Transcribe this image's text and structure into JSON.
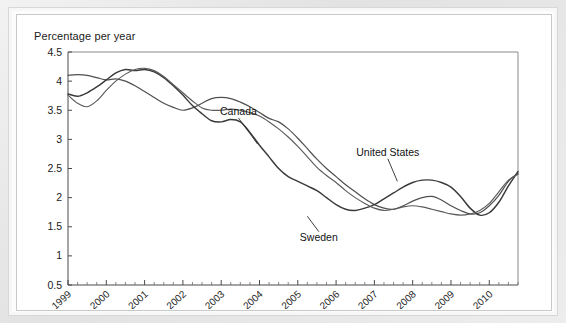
{
  "chart_data": {
    "type": "line",
    "title": "",
    "subtitle": "",
    "ylabel": "Percentage per year",
    "xlabel": "",
    "ylim": [
      0.5,
      4.5
    ],
    "ytick_labels": [
      "4.5",
      "4",
      "3.5",
      "3",
      "2.5",
      "2",
      "1.5",
      "1",
      "0.5"
    ],
    "ytick_values": [
      4.5,
      4,
      3.5,
      3,
      2.5,
      2,
      1.5,
      1,
      0.5
    ],
    "xlim": [
      1999,
      2010.75
    ],
    "xtick_labels": [
      "1999",
      "2000",
      "2001",
      "2002",
      "2003",
      "2004",
      "2005",
      "2006",
      "2007",
      "2008",
      "2009",
      "2010"
    ],
    "xtick_values": [
      1999,
      2000,
      2001,
      2002,
      2003,
      2004,
      2005,
      2006,
      2007,
      2008,
      2009,
      2010
    ],
    "minor_ticks_per_interval": 4,
    "grid": false,
    "legend_position": "inline-annotations",
    "annotations": [
      {
        "label": "Canada",
        "x": 2003.45,
        "y": 3.42,
        "anchor_x": 2003.95,
        "anchor_y": 2.92
      },
      {
        "label": "United States",
        "x": 2007.35,
        "y": 2.72,
        "anchor_x": 2007.6,
        "anchor_y": 2.28
      },
      {
        "label": "Sweden",
        "x": 2005.55,
        "y": 1.26,
        "anchor_x": 2005.25,
        "anchor_y": 1.68
      }
    ],
    "series": [
      {
        "name": "Canada",
        "color": "#4f4f4f",
        "width": 1.2,
        "x": [
          1999.0,
          1999.25,
          1999.5,
          1999.75,
          2000.0,
          2000.25,
          2000.5,
          2000.75,
          2001.0,
          2001.25,
          2001.5,
          2001.75,
          2002.0,
          2002.25,
          2002.5,
          2002.75,
          2003.0,
          2003.25,
          2003.5,
          2003.75,
          2004.0,
          2004.25,
          2004.5,
          2004.75,
          2005.0,
          2005.25,
          2005.5,
          2005.75,
          2006.0,
          2006.25,
          2006.5,
          2006.75,
          2007.0,
          2007.25,
          2007.5,
          2007.75,
          2008.0,
          2008.25,
          2008.5,
          2008.75,
          2009.0,
          2009.25,
          2009.5,
          2009.75,
          2010.0,
          2010.25,
          2010.5,
          2010.75
        ],
        "y": [
          4.1,
          4.11,
          4.1,
          4.06,
          4.02,
          4.04,
          4.0,
          3.92,
          3.82,
          3.72,
          3.62,
          3.55,
          3.5,
          3.54,
          3.62,
          3.7,
          3.72,
          3.7,
          3.64,
          3.56,
          3.46,
          3.36,
          3.3,
          3.18,
          3.02,
          2.84,
          2.66,
          2.5,
          2.36,
          2.22,
          2.1,
          1.98,
          1.88,
          1.82,
          1.8,
          1.86,
          1.94,
          2.0,
          2.02,
          1.96,
          1.86,
          1.78,
          1.72,
          1.74,
          1.86,
          2.04,
          2.28,
          2.42
        ]
      },
      {
        "name": "United States",
        "color": "#3a3a3a",
        "width": 1.45,
        "x": [
          1999.0,
          1999.25,
          1999.5,
          1999.75,
          2000.0,
          2000.25,
          2000.5,
          2000.75,
          2001.0,
          2001.25,
          2001.5,
          2001.75,
          2002.0,
          2002.25,
          2002.5,
          2002.75,
          2003.0,
          2003.25,
          2003.5,
          2003.75,
          2004.0,
          2004.25,
          2004.5,
          2004.75,
          2005.0,
          2005.25,
          2005.5,
          2005.75,
          2006.0,
          2006.25,
          2006.5,
          2006.75,
          2007.0,
          2007.25,
          2007.5,
          2007.75,
          2008.0,
          2008.25,
          2008.5,
          2008.75,
          2009.0,
          2009.25,
          2009.5,
          2009.75,
          2010.0,
          2010.25,
          2010.5,
          2010.75
        ],
        "y": [
          3.78,
          3.74,
          3.8,
          3.9,
          4.02,
          4.14,
          4.2,
          4.18,
          4.2,
          4.16,
          4.06,
          3.92,
          3.76,
          3.58,
          3.44,
          3.32,
          3.3,
          3.34,
          3.3,
          3.12,
          2.9,
          2.7,
          2.5,
          2.36,
          2.28,
          2.2,
          2.12,
          2.0,
          1.88,
          1.8,
          1.78,
          1.82,
          1.88,
          1.98,
          2.08,
          2.18,
          2.26,
          2.3,
          2.3,
          2.26,
          2.18,
          2.02,
          1.82,
          1.7,
          1.74,
          1.92,
          2.2,
          2.45
        ]
      },
      {
        "name": "Sweden",
        "color": "#5a5a5a",
        "width": 1.15,
        "x": [
          1999.0,
          1999.25,
          1999.5,
          1999.75,
          2000.0,
          2000.25,
          2000.5,
          2000.75,
          2001.0,
          2001.25,
          2001.5,
          2001.75,
          2002.0,
          2002.25,
          2002.5,
          2002.75,
          2003.0,
          2003.25,
          2003.5,
          2003.75,
          2004.0,
          2004.25,
          2004.5,
          2004.75,
          2005.0,
          2005.25,
          2005.5,
          2005.75,
          2006.0,
          2006.25,
          2006.5,
          2006.75,
          2007.0,
          2007.25,
          2007.5,
          2007.75,
          2008.0,
          2008.25,
          2008.5,
          2008.75,
          2009.0,
          2009.25,
          2009.5,
          2009.75,
          2010.0,
          2010.25,
          2010.5,
          2010.75
        ],
        "y": [
          3.76,
          3.62,
          3.56,
          3.66,
          3.84,
          4.0,
          4.12,
          4.2,
          4.22,
          4.18,
          4.08,
          3.94,
          3.8,
          3.66,
          3.54,
          3.5,
          3.5,
          3.52,
          3.5,
          3.46,
          3.4,
          3.3,
          3.18,
          3.04,
          2.88,
          2.7,
          2.52,
          2.38,
          2.26,
          2.12,
          2.0,
          1.9,
          1.82,
          1.78,
          1.8,
          1.84,
          1.86,
          1.84,
          1.8,
          1.76,
          1.72,
          1.7,
          1.72,
          1.78,
          1.9,
          2.1,
          2.3,
          2.4
        ]
      }
    ]
  }
}
